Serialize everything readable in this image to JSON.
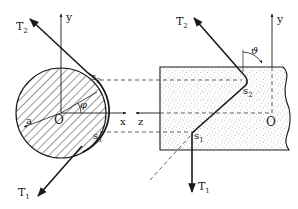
{
  "diagram": {
    "left_view": {
      "labels": {
        "tension_top": "T",
        "tension_top_sub": "2",
        "tension_bottom": "T",
        "tension_bottom_sub": "1",
        "point_top": "s",
        "point_top_sub": "2",
        "point_bottom": "s",
        "point_bottom_sub": "1",
        "origin": "O",
        "radius": "a",
        "angle": "φ",
        "axis_y": "y",
        "axis_x": "x"
      }
    },
    "right_view": {
      "labels": {
        "tension_top": "T",
        "tension_top_sub": "2",
        "tension_bottom": "T",
        "tension_bottom_sub": "1",
        "point_top": "s",
        "point_top_sub": "2",
        "point_bottom": "s",
        "point_bottom_sub": "1",
        "origin": "O",
        "angle": "ϑ",
        "axis_y": "y",
        "axis_z": "z"
      }
    },
    "colors": {
      "ink": "#1a1a1a",
      "stipple": "#6e6e6e",
      "background": "#ffffff"
    }
  }
}
